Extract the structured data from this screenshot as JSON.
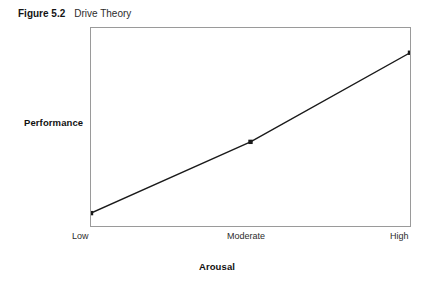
{
  "caption": {
    "number": "Figure 5.2",
    "title": "Drive Theory"
  },
  "chart_data": {
    "type": "line",
    "title": "Drive Theory",
    "xlabel": "Arousal",
    "ylabel": "Performance",
    "categories": [
      "Low",
      "Moderate",
      "High"
    ],
    "x": [
      0,
      0.5,
      1
    ],
    "values": [
      0.065,
      0.425,
      0.875
    ],
    "series": [
      {
        "name": "Drive Theory",
        "values": [
          0.065,
          0.425,
          0.875
        ]
      }
    ],
    "xlim": [
      0,
      1
    ],
    "ylim": [
      0,
      1
    ],
    "grid": false,
    "legend": false,
    "marker": "square",
    "line_color": "#1a1a1a",
    "marker_color": "#1a1a1a",
    "frame_color": "#9a9a9a",
    "background": "#ffffff",
    "annotations": []
  },
  "axes": {
    "y_title": "Performance",
    "x_title": "Arousal",
    "x_ticks": [
      {
        "label": "Low"
      },
      {
        "label": "Moderate"
      },
      {
        "label": "High"
      }
    ]
  }
}
